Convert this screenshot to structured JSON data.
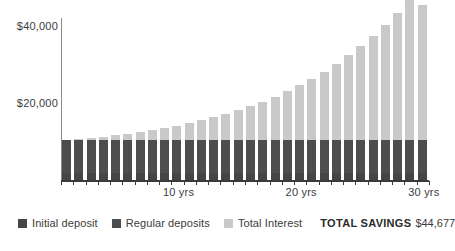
{
  "chart_data": {
    "type": "bar",
    "title": "",
    "subtitle": "",
    "xlabel": "",
    "ylabel": "",
    "stacked": true,
    "grid": false,
    "legend_position": "bottom-left",
    "ylim": [
      0,
      46000
    ],
    "ytick_labels": [
      "$20,000",
      "$40,000"
    ],
    "ytick_values": [
      20000,
      40000
    ],
    "xtick_labels": [
      "10 yrs",
      "20 yrs",
      "30 yrs"
    ],
    "xtick_values": [
      10,
      20,
      30
    ],
    "x": [
      1,
      2,
      3,
      4,
      5,
      6,
      7,
      8,
      9,
      10,
      11,
      12,
      13,
      14,
      15,
      16,
      17,
      18,
      19,
      20,
      21,
      22,
      23,
      24,
      25,
      26,
      27,
      28,
      29,
      30
    ],
    "series": [
      {
        "name": "Initial deposit",
        "color": "#454545",
        "values": [
          2000,
          2000,
          2000,
          2000,
          2000,
          2000,
          2000,
          2000,
          2000,
          2000,
          2000,
          2000,
          2000,
          2000,
          2000,
          2000,
          2000,
          2000,
          2000,
          2000,
          2000,
          2000,
          2000,
          2000,
          2000,
          2000,
          2000,
          2000,
          2000,
          2000
        ]
      },
      {
        "name": "Regular deposits",
        "color": "#4d4d4d",
        "values": [
          8400,
          8400,
          8400,
          8400,
          8400,
          8400,
          8400,
          8400,
          8400,
          8400,
          8400,
          8400,
          8400,
          8400,
          8400,
          8400,
          8400,
          8400,
          8400,
          8400,
          8400,
          8400,
          8400,
          8400,
          8400,
          8400,
          8400,
          8400,
          8400,
          8400
        ]
      },
      {
        "name": "Total Interest",
        "color": "#c9c9c9",
        "values": [
          0,
          250,
          530,
          840,
          1190,
          1580,
          2010,
          2490,
          3020,
          3610,
          4260,
          4980,
          5770,
          6640,
          7600,
          8650,
          9800,
          11060,
          12440,
          13950,
          15600,
          17400,
          19370,
          21520,
          23870,
          26430,
          29220,
          32260,
          35570,
          34277
        ]
      }
    ],
    "totals": [
      10400,
      10650,
      10930,
      11240,
      11590,
      11980,
      12410,
      12890,
      13420,
      14010,
      14660,
      15380,
      16170,
      17040,
      18000,
      19050,
      20200,
      21460,
      22840,
      24350,
      26000,
      27800,
      29770,
      31920,
      34270,
      36830,
      39620,
      42660,
      45970,
      44677
    ],
    "annotations": [
      {
        "label": "TOTAL SAVINGS",
        "value": "$44,677"
      }
    ]
  },
  "axes": {
    "y_labels": [
      {
        "text": "$40,000",
        "value": 40000
      },
      {
        "text": "$20,000",
        "value": 20000
      }
    ],
    "x_labels": [
      {
        "text": "10 yrs",
        "value": 10
      },
      {
        "text": "20 yrs",
        "value": 20
      },
      {
        "text": "30 yrs",
        "value": 30
      }
    ]
  },
  "legend": {
    "items": [
      {
        "label": "Initial deposit",
        "color": "#454545"
      },
      {
        "label": "Regular deposits",
        "color": "#4d4d4d"
      },
      {
        "label": "Total Interest",
        "color": "#c9c9c9"
      }
    ],
    "total_label": "TOTAL SAVINGS",
    "total_value": "$44,677"
  },
  "colors": {
    "initial_deposit": "#454545",
    "regular_deposits": "#4d4d4d",
    "total_interest": "#c9c9c9",
    "axis": "#3b3b3b",
    "background": "#ffffff"
  }
}
